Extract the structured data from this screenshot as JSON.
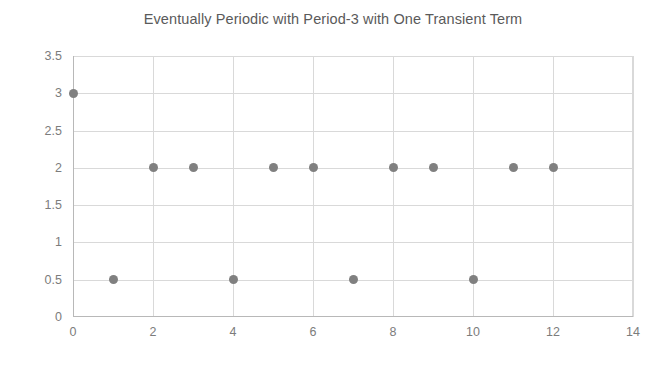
{
  "chart_data": {
    "type": "scatter",
    "title": "Eventually Periodic with Period-3 with One Transient Term",
    "xlabel": "",
    "ylabel": "",
    "x": [
      0,
      1,
      2,
      3,
      4,
      5,
      6,
      7,
      8,
      9,
      10,
      11,
      12
    ],
    "values": [
      3,
      0.5,
      2,
      2,
      0.5,
      2,
      2,
      0.5,
      2,
      2,
      0.5,
      2,
      2
    ],
    "points": [
      {
        "x": 0,
        "y": 3
      },
      {
        "x": 1,
        "y": 0.5
      },
      {
        "x": 2,
        "y": 2
      },
      {
        "x": 3,
        "y": 2
      },
      {
        "x": 4,
        "y": 0.5
      },
      {
        "x": 5,
        "y": 2
      },
      {
        "x": 6,
        "y": 2
      },
      {
        "x": 7,
        "y": 0.5
      },
      {
        "x": 8,
        "y": 2
      },
      {
        "x": 9,
        "y": 2
      },
      {
        "x": 10,
        "y": 0.5
      },
      {
        "x": 11,
        "y": 2
      },
      {
        "x": 12,
        "y": 2
      }
    ],
    "xlim": [
      0,
      14
    ],
    "ylim": [
      0,
      3.5
    ],
    "xticks": [
      0,
      2,
      4,
      6,
      8,
      10,
      12,
      14
    ],
    "xtick_labels": [
      "0",
      "2",
      "4",
      "6",
      "8",
      "10",
      "12",
      "14"
    ],
    "yticks": [
      0,
      0.5,
      1,
      1.5,
      2,
      2.5,
      3,
      3.5
    ],
    "ytick_labels": [
      "0",
      "0.5",
      "1",
      "1.5",
      "2",
      "2.5",
      "3",
      "3.5"
    ],
    "grid": true,
    "grid_axes": "both",
    "legend": false,
    "legend_position": "none",
    "marker_color": "#808080",
    "marker_shape": "circle",
    "grid_color": "#d9d9d9",
    "axis_color": "#b8b8b8",
    "tick_label_color": "#7c7c7c",
    "title_color": "#5a5a5a",
    "background_color": "#ffffff"
  }
}
